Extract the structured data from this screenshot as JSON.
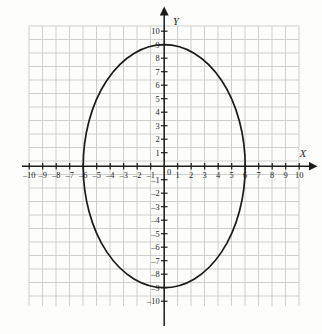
{
  "figure": {
    "kind": "coordinate-grid-plot",
    "background_color": "#fdfdfb",
    "grid_color": "#c9c9c9",
    "axis_color": "#1c1c1c",
    "curve_color": "#1a1a1a"
  },
  "axes": {
    "x": {
      "name": "X",
      "name_position": "right-end-above-arrow",
      "has_arrow_right": true,
      "has_arrow_left": false,
      "ticks": [
        -10,
        -9,
        -8,
        -7,
        -6,
        -5,
        -4,
        -3,
        -2,
        -1,
        1,
        2,
        3,
        4,
        5,
        6,
        7,
        8,
        9,
        10
      ],
      "tick_labels": [
        "–10",
        "–9",
        "–8",
        "–7",
        "–6",
        "–5",
        "–4",
        "–3",
        "–2",
        "–1",
        "1",
        "2",
        "3",
        "4",
        "5",
        "6",
        "7",
        "8",
        "9",
        "10"
      ],
      "range": [
        -10,
        10
      ]
    },
    "y": {
      "name": "Y",
      "name_position": "top-end-right-of-arrow",
      "has_arrow_up": true,
      "has_arrow_down": false,
      "ticks": [
        10,
        9,
        8,
        7,
        6,
        5,
        4,
        3,
        2,
        1,
        -1,
        -2,
        -3,
        -4,
        -5,
        -6,
        -7,
        -8,
        -9,
        -10
      ],
      "tick_labels": [
        "10",
        "9",
        "8",
        "7",
        "6",
        "5",
        "4",
        "3",
        "2",
        "1",
        "–1",
        "–2",
        "–3",
        "–4",
        "–5",
        "–6",
        "–7",
        "–8",
        "–9",
        "–10"
      ],
      "range": [
        -10,
        10
      ]
    },
    "origin_label": "0"
  },
  "chart_data": {
    "type": "line",
    "title": "",
    "xlabel": "X",
    "ylabel": "Y",
    "xlim": [
      -10,
      10
    ],
    "ylim": [
      -10,
      10
    ],
    "grid": true,
    "legend": "none",
    "series": [
      {
        "name": "ellipse",
        "shape": "ellipse",
        "equation": "x^2/36 + y^2/81 = 1",
        "center": [
          0,
          0
        ],
        "semi_axis_x": 6,
        "semi_axis_y": 9,
        "x_intercepts": [
          -6,
          6
        ],
        "y_intercepts": [
          -9,
          9
        ],
        "closed": true,
        "color": "#1a1a1a"
      }
    ]
  }
}
